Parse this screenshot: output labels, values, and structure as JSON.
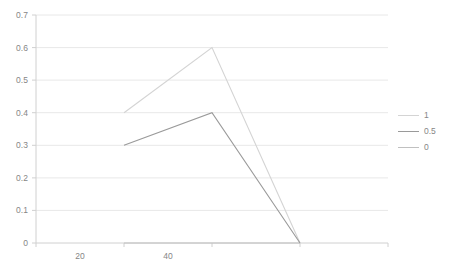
{
  "chart_data": {
    "type": "line",
    "title": "",
    "xlabel": "",
    "ylabel": "",
    "xlim": [
      0,
      80
    ],
    "ylim": [
      0,
      0.7
    ],
    "grid": true,
    "legend_position": "right",
    "x": [
      20,
      40,
      60
    ],
    "y_ticks": [
      "0",
      "0.1",
      "0.2",
      "0.3",
      "0.4",
      "0.5",
      "0.6",
      "0.7"
    ],
    "y_tick_values": [
      0,
      0.1,
      0.2,
      0.3,
      0.4,
      0.5,
      0.6,
      0.7
    ],
    "x_ticks": [
      "20",
      "40"
    ],
    "x_tick_values": [
      20,
      40
    ],
    "series": [
      {
        "name": "1",
        "color": "#d4d4d4",
        "values": [
          0.4,
          0.6,
          0
        ]
      },
      {
        "name": "0.5",
        "color": "#9a9a9a",
        "values": [
          0.3,
          0.4,
          0
        ]
      },
      {
        "name": "0",
        "color": "#c0c0c0",
        "values": [
          0,
          0,
          0
        ]
      }
    ]
  },
  "axes": {
    "gridline_color": "#e8e8e8",
    "axis_color": "#d0d0d0",
    "tick_text_color": "#868686"
  }
}
